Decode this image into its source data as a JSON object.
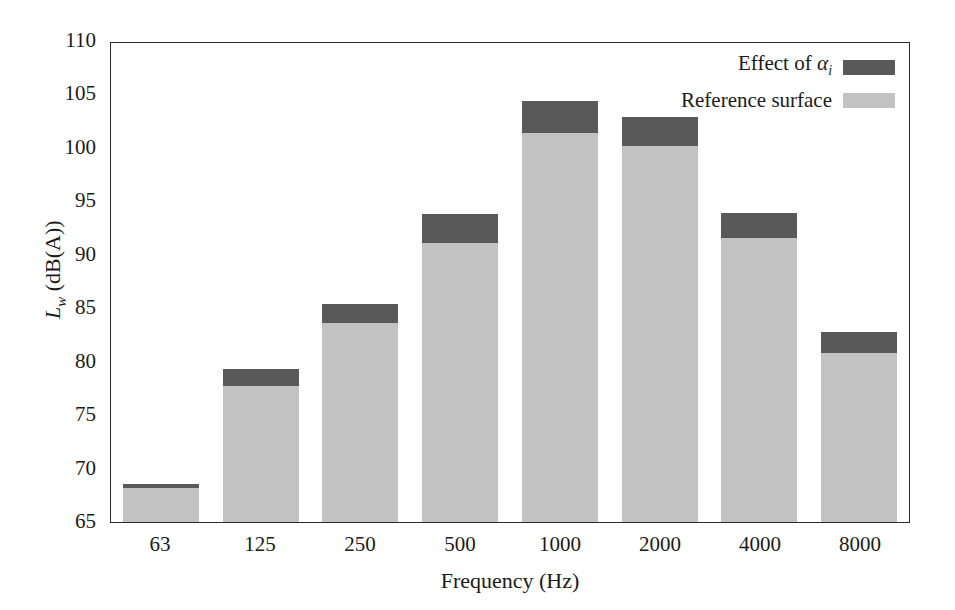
{
  "chart_data": {
    "type": "bar",
    "stacked": true,
    "title": "",
    "xlabel": "Frequency (Hz)",
    "ylabel": "L_w (dB(A))",
    "categories": [
      "63",
      "125",
      "250",
      "500",
      "1000",
      "2000",
      "4000",
      "8000"
    ],
    "ylim": [
      65,
      110
    ],
    "yticks": [
      65,
      70,
      75,
      80,
      85,
      90,
      95,
      100,
      105,
      110
    ],
    "ytick_labels": [
      "65",
      "70",
      "75",
      "80",
      "85",
      "90",
      "95",
      "100",
      "105",
      "110"
    ],
    "grid": false,
    "legend_position": "upper right",
    "series": [
      {
        "name": "Reference surface",
        "color": "#c2c2c2",
        "values": [
          68.2,
          77.7,
          83.6,
          91.1,
          101.4,
          100.2,
          91.6,
          80.8
        ]
      },
      {
        "name": "Effect of αi",
        "color": "#595959",
        "values": [
          0.4,
          1.6,
          1.8,
          2.7,
          3.0,
          2.7,
          2.3,
          2.0
        ]
      }
    ],
    "totals": [
      68.6,
      79.3,
      85.4,
      93.8,
      104.4,
      102.9,
      93.9,
      82.8
    ]
  },
  "axes": {
    "y_title_main": "L",
    "y_title_sub": "w",
    "y_title_unit": " (dB(A))",
    "x_title": "Frequency (Hz)"
  },
  "legend": {
    "items": [
      {
        "label_prefix": "Effect of ",
        "label_symbol": "α",
        "label_sub": "i",
        "swatch_color": "#595959",
        "name": "effect-of-alpha"
      },
      {
        "label_prefix": "Reference surface",
        "label_symbol": "",
        "label_sub": "",
        "swatch_color": "#c2c2c2",
        "name": "reference-surface"
      }
    ]
  },
  "colors": {
    "effect": "#595959",
    "reference": "#c2c2c2",
    "axis": "#2b2b2b",
    "background": "#ffffff"
  }
}
